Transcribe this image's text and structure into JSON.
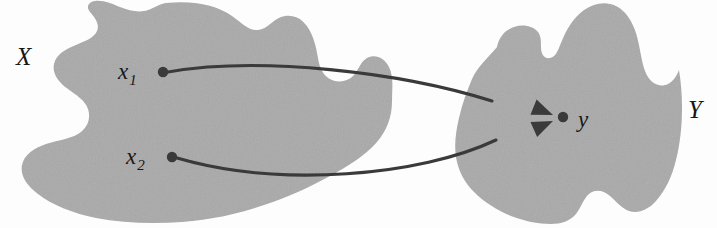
{
  "figure": {
    "width": 717,
    "height": 228,
    "background_color": "#fdfdfd"
  },
  "colors": {
    "blob_fill": "#a9a9a9",
    "ink": "#3a3a3a",
    "label_ink": "#171717"
  },
  "sets": [
    {
      "name": "set-x",
      "label": "X",
      "label_x": 16,
      "label_y": 44,
      "fill": "#a9a9a9"
    },
    {
      "name": "set-y",
      "label": "Y",
      "label_x": 688,
      "label_y": 97,
      "fill": "#a9a9a9"
    }
  ],
  "points": [
    {
      "name": "point-x1",
      "label_base": "x",
      "label_sub": "1",
      "cx": 163,
      "cy": 72,
      "r": 5.2,
      "label_x": 118,
      "label_y": 60
    },
    {
      "name": "point-x2",
      "label_base": "x",
      "label_sub": "2",
      "cx": 172,
      "cy": 157,
      "r": 5.2,
      "label_x": 126,
      "label_y": 145
    },
    {
      "name": "point-y",
      "label_base": "y",
      "label_sub": "",
      "cx": 563,
      "cy": 117,
      "r": 5.2,
      "label_x": 578,
      "label_y": 108
    }
  ],
  "arrows": [
    {
      "name": "arrow-x1-to-y",
      "from": "point-x1",
      "to": "point-y",
      "stroke_width": 3.1,
      "path": "M 168,72 C 260,56 400,72 492,101",
      "head_tip_x": 553,
      "head_tip_y": 115,
      "head_angle_deg": 22
    },
    {
      "name": "arrow-x2-to-y",
      "from": "point-x2",
      "to": "point-y",
      "stroke_width": 3.1,
      "path": "M 177,158 C 280,188 420,176 496,140",
      "head_tip_x": 553,
      "head_tip_y": 121,
      "head_angle_deg": -24
    }
  ],
  "shapes": {
    "blob_x_path": "M 166,3 C 196,0 218,6 232,16 C 243,24 249,31 258,30 C 268,29 272,20 281,17 C 296,12 306,22 311,33 C 318,48 317,60 321,69 C 327,82 340,84 349,79 C 355,76 357,70 361,64 C 369,52 383,55 389,67 C 394,77 392,90 392,101 C 392,117 387,130 377,142 C 365,156 348,166 330,176 C 310,187 288,197 264,205 C 238,214 210,220 182,222 C 152,224 122,223 96,218 C 72,213 52,205 38,194 C 26,185 20,175 22,165 C 24,155 34,148 46,144 C 58,140 70,139 78,134 C 88,128 91,118 88,109 C 85,100 76,95 68,89 C 58,82 52,73 54,64 C 56,54 66,49 76,45 C 85,41 94,38 97,31 C 100,24 95,18 90,12 C 86,7 88,2 95,1 C 104,0 112,4 120,7 C 130,11 140,13 148,10 C 154,8 159,4 166,3 Z",
    "blob_y_path": "M 497,47 C 499,37 505,30 514,27 C 523,24 533,26 538,32 C 541,36 541,41 541,47 C 541,54 544,59 550,58 C 556,57 558,50 561,43 C 566,30 573,18 584,10 C 594,3 606,1 616,6 C 626,11 632,21 636,33 C 640,46 641,60 645,71 C 650,84 660,88 668,84 C 674,81 677,75 679,70 C 681,82 682,95 682,108 C 682,126 680,144 676,160 C 672,177 665,191 656,201 C 648,210 638,214 629,211 C 621,208 616,201 610,196 C 603,190 595,189 589,194 C 583,199 581,208 576,214 C 570,221 561,224 551,224 C 538,224 524,221 511,216 C 497,210 484,202 474,192 C 464,182 458,170 456,157 C 454,144 456,131 459,118 C 462,104 467,91 472,79 C 478,66 488,58 497,47 Z"
  }
}
